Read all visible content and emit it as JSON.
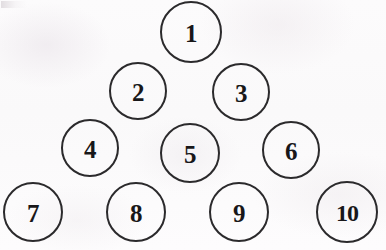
{
  "diagram": {
    "background_color": "#fbfafb",
    "stroke_color": "#2b2a2c",
    "label_color": "#181719",
    "canvas": {
      "width": 386,
      "height": 250
    },
    "rows": [
      {
        "row": 1,
        "count": 1
      },
      {
        "row": 2,
        "count": 2
      },
      {
        "row": 3,
        "count": 3
      },
      {
        "row": 4,
        "count": 4
      }
    ],
    "nodes": [
      {
        "id": "circle-1",
        "label": "1",
        "cx": 191,
        "cy": 32,
        "r": 31,
        "row": 1
      },
      {
        "id": "circle-2",
        "label": "2",
        "cx": 138,
        "cy": 91,
        "r": 29,
        "row": 2
      },
      {
        "id": "circle-3",
        "label": "3",
        "cx": 241,
        "cy": 92,
        "r": 29,
        "row": 2
      },
      {
        "id": "circle-4",
        "label": "4",
        "cx": 90,
        "cy": 148,
        "r": 29,
        "row": 3
      },
      {
        "id": "circle-5",
        "label": "5",
        "cx": 190,
        "cy": 153,
        "r": 30,
        "row": 3
      },
      {
        "id": "circle-6",
        "label": "6",
        "cx": 291,
        "cy": 150,
        "r": 29,
        "row": 3
      },
      {
        "id": "circle-7",
        "label": "7",
        "cx": 33,
        "cy": 212,
        "r": 30,
        "row": 4
      },
      {
        "id": "circle-8",
        "label": "8",
        "cx": 136,
        "cy": 212,
        "r": 30,
        "row": 4
      },
      {
        "id": "circle-9",
        "label": "9",
        "cx": 239,
        "cy": 212,
        "r": 30,
        "row": 4
      },
      {
        "id": "circle-10",
        "label": "10",
        "cx": 347,
        "cy": 212,
        "r": 31,
        "row": 4
      }
    ]
  }
}
